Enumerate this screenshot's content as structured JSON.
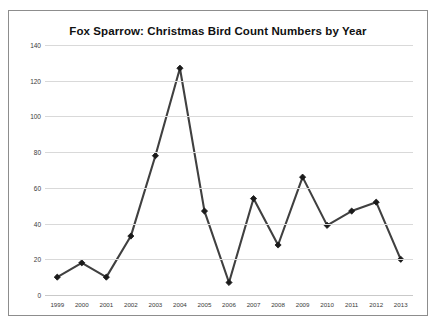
{
  "chart_data": {
    "type": "line",
    "title": "Fox Sparrow: Christmas Bird Count Numbers by Year",
    "xlabel": "",
    "ylabel": "",
    "categories": [
      "1999",
      "2000",
      "2001",
      "2002",
      "2003",
      "2004",
      "2005",
      "2006",
      "2007",
      "2008",
      "2009",
      "2010",
      "2011",
      "2012",
      "2013"
    ],
    "x": [
      1999,
      2000,
      2001,
      2002,
      2003,
      2004,
      2005,
      2006,
      2007,
      2008,
      2009,
      2010,
      2011,
      2012,
      2013
    ],
    "values": [
      10,
      18,
      10,
      33,
      78,
      127,
      47,
      7,
      54,
      28,
      66,
      39,
      47,
      52,
      20
    ],
    "series": [
      {
        "name": "Fox Sparrow",
        "values": [
          10,
          18,
          10,
          33,
          78,
          127,
          47,
          7,
          54,
          28,
          66,
          39,
          47,
          52,
          20
        ]
      }
    ],
    "ylim": [
      0,
      140
    ],
    "yticks": [
      0,
      20,
      40,
      60,
      80,
      100,
      120,
      140
    ],
    "ytick_labels": [
      "0",
      "20",
      "40",
      "60",
      "80",
      "100",
      "120",
      "140"
    ],
    "grid": true,
    "legend": false,
    "legend_position": "none",
    "line_color": "#404040",
    "marker": "diamond",
    "marker_color": "#1a1a1a",
    "gridline_color": "#d9d9d9",
    "border_color": "#8d8d8d",
    "background": "#ffffff"
  }
}
